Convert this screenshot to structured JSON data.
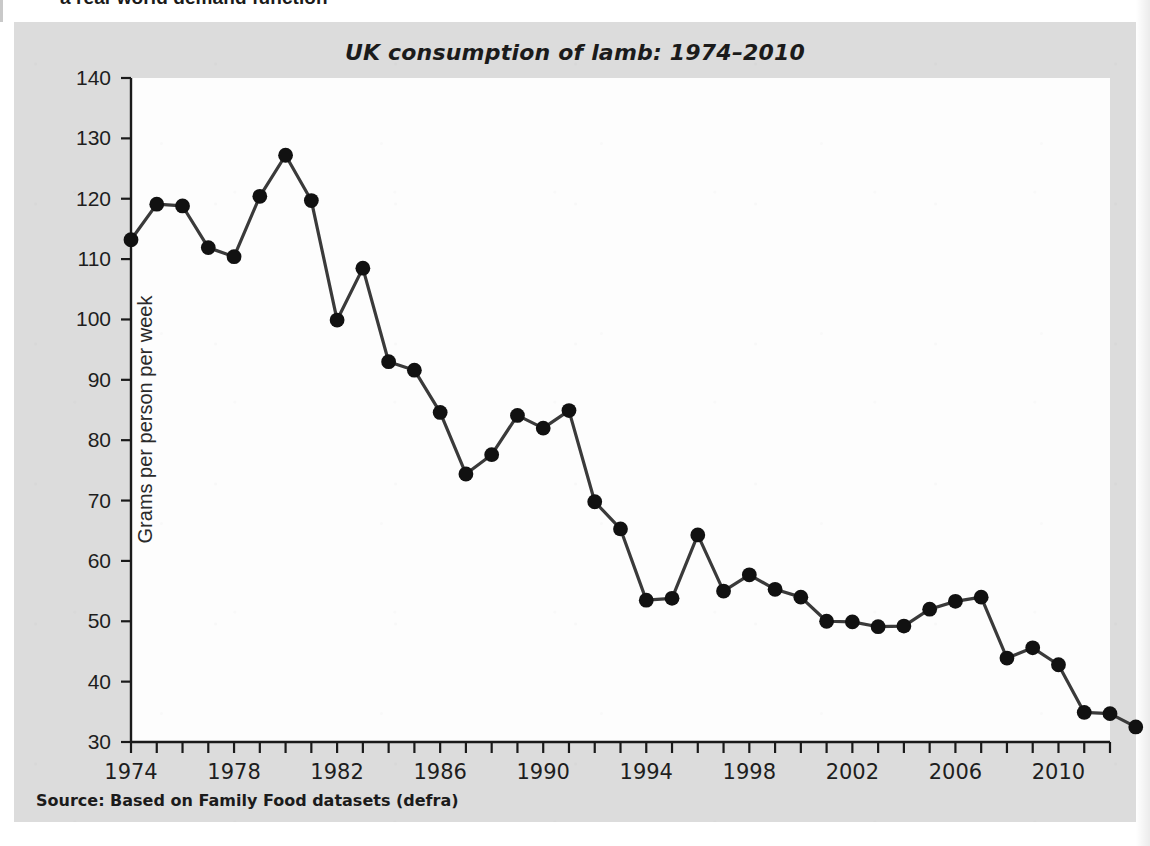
{
  "page": {
    "clipped_heading": "a real-world demand function"
  },
  "figure": {
    "title": "UK consumption of lamb: 1974–2010",
    "source": "Source: Based on Family Food datasets (defra)",
    "colors": {
      "panel_background": "#dcdcdc",
      "plot_background": "#fdfdfd",
      "line": "#3a3a3a",
      "marker": "#111111",
      "axis": "#1a1a1a",
      "text": "#1e1e1e"
    }
  },
  "chart_data": {
    "type": "line",
    "title": "UK consumption of lamb: 1974–2010",
    "xlabel": "",
    "ylabel": "Grams per person per week",
    "xlim": [
      1974,
      2012
    ],
    "ylim": [
      30,
      140
    ],
    "ytick_step": 10,
    "yticks": [
      30,
      40,
      50,
      60,
      70,
      80,
      90,
      100,
      110,
      120,
      130,
      140
    ],
    "xticks_labeled": [
      1974,
      1978,
      1982,
      1986,
      1990,
      1994,
      1998,
      2002,
      2006,
      2010
    ],
    "xtick_minor_step": 1,
    "grid": false,
    "legend": false,
    "marker": "filled-circle",
    "series": [
      {
        "name": "UK lamb consumption",
        "x": [
          1974,
          1975,
          1976,
          1977,
          1978,
          1979,
          1980,
          1981,
          1982,
          1983,
          1984,
          1985,
          1986,
          1987,
          1988,
          1989,
          1990,
          1991,
          1992,
          1993,
          1994,
          1995,
          1996,
          1997,
          1998,
          1999,
          2000,
          2001,
          2002,
          2003,
          2004,
          2005,
          2006,
          2007,
          2008,
          2009,
          2010,
          2011,
          2012
        ],
        "values": [
          113.2,
          119.1,
          118.8,
          111.9,
          110.4,
          120.4,
          127.2,
          119.7,
          99.9,
          108.5,
          93.0,
          91.6,
          84.6,
          74.4,
          77.6,
          84.1,
          82.0,
          84.9,
          69.8,
          65.3,
          53.5,
          53.8,
          64.3,
          55.0,
          57.7,
          55.3,
          54.0,
          50.0,
          49.9,
          49.1,
          49.2,
          52.0,
          53.3,
          54.0,
          43.9,
          45.6,
          42.8,
          34.9,
          34.7
        ],
        "last_value": 32.5
      }
    ]
  },
  "axis_text": {
    "y_label": "Grams per person per week"
  }
}
